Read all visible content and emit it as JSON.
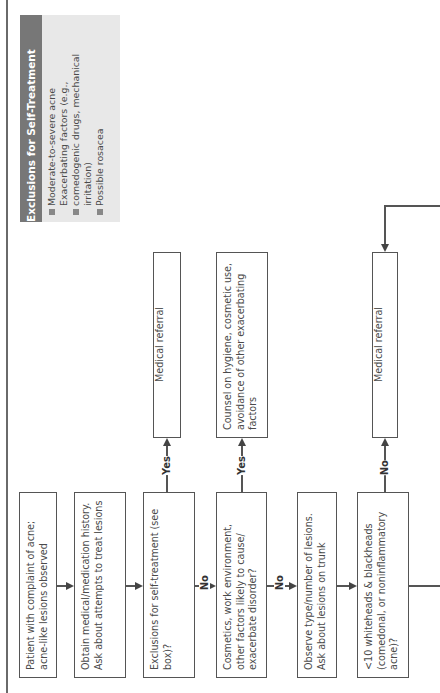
{
  "exclusions_box": {
    "title": "Exclusions for Self-Treatment",
    "items": [
      "Moderate-to-severe acne",
      "Exacerbating factors (e.g., comedogenic drugs, mechanical irritation)",
      "Possible rosacea"
    ],
    "header_color": "#777777",
    "background_color": "#e8e8e8"
  },
  "flowchart": {
    "steps": [
      {
        "id": "start",
        "text": "Patient with complaint of acne; acne-like lesions observed"
      },
      {
        "id": "history",
        "text": "Obtain medical/medication history. Ask about attempts to treat lesions"
      },
      {
        "id": "exclusions_q",
        "text": "Exclusions for self-treatment (see box)?"
      },
      {
        "id": "cosmetics_q",
        "text": "Cosmetics, work environment, other factors likely to cause/ exacerbate disorder?"
      },
      {
        "id": "observe",
        "text": "Observe type/number of lesions. Ask about lesions on trunk"
      },
      {
        "id": "count_q",
        "text": "<10 whiteheads & blackheads (comedonal, or noninflammatory acne)?"
      }
    ],
    "outcomes": [
      {
        "id": "referral_1",
        "text": "Medical referral"
      },
      {
        "id": "counsel",
        "text": "Counsel on hygiene, cosmetic use, avoidance of other exacerbating factors"
      },
      {
        "id": "referral_2",
        "text": "Medical referral"
      }
    ],
    "labels": {
      "yes": "Yes",
      "no": "No"
    }
  }
}
